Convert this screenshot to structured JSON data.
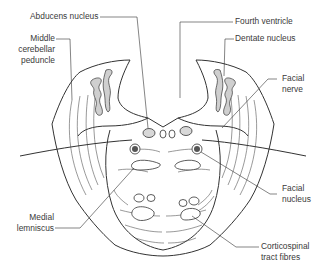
{
  "diagram": {
    "labels": {
      "abducens_nucleus": "Abducens nucleus",
      "middle_cerebellar_peduncle": [
        "Middle",
        "cerebellar",
        "peduncle"
      ],
      "fourth_ventricle": "Fourth ventricle",
      "dentate_nucleus": "Dentate nucleus",
      "facial_nerve": [
        "Facial",
        "nerve"
      ],
      "facial_nucleus": [
        "Facial",
        "nucleus"
      ],
      "medial_lemniscus": [
        "Medial",
        "lemniscus"
      ],
      "corticospinal_tract_fibres": [
        "Corticospinal",
        "tract fibres"
      ]
    },
    "colors": {
      "outline": "#333333",
      "nucleus_fill": "#d8d8d8",
      "text": "#3a3a3a"
    }
  }
}
